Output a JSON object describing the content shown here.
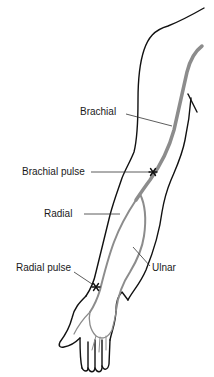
{
  "diagram": {
    "colors": {
      "outline": "#111111",
      "artery": "#8c8c8c",
      "leader": "#333333",
      "pulse_marker": "#111111"
    },
    "labels": {
      "brachial": "Brachial",
      "brachial_pulse": "Brachial pulse",
      "radial": "Radial",
      "radial_pulse": "Radial pulse",
      "ulnar": "Ulnar"
    },
    "pulse_marker_glyph": "✱"
  }
}
